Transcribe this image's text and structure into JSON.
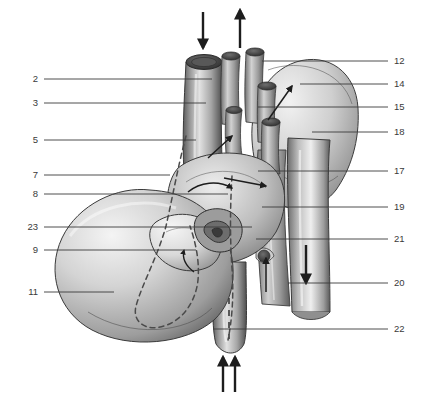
{
  "figure": {
    "style": "grayscale pen-and-ink anatomical illustration",
    "background_color": "#ffffff",
    "line_color": "#3a3a3a",
    "label_color": "#3a3a3a",
    "ink_dark": "#2b2b2b",
    "ink_mid": "#8d8d8d",
    "ink_light": "#d8d8d8"
  },
  "labels_left": [
    {
      "number": "2",
      "y": 79,
      "line_to_x": 212
    },
    {
      "number": "3",
      "y": 103,
      "line_to_x": 206
    },
    {
      "number": "5",
      "y": 140,
      "line_to_x": 196
    },
    {
      "number": "7",
      "y": 175,
      "line_to_x": 170
    },
    {
      "number": "8",
      "y": 194,
      "line_to_x": 228
    },
    {
      "number": "23",
      "y": 227,
      "line_to_x": 252
    },
    {
      "number": "9",
      "y": 250,
      "line_to_x": 196
    },
    {
      "number": "11",
      "y": 292,
      "line_to_x": 114
    }
  ],
  "labels_right": [
    {
      "number": "12",
      "y": 61,
      "line_from_x": 262
    },
    {
      "number": "14",
      "y": 84,
      "line_from_x": 300
    },
    {
      "number": "15",
      "y": 107,
      "line_from_x": 258
    },
    {
      "number": "18",
      "y": 132,
      "line_from_x": 312
    },
    {
      "number": "17",
      "y": 171,
      "line_from_x": 258
    },
    {
      "number": "19",
      "y": 207,
      "line_from_x": 262
    },
    {
      "number": "21",
      "y": 239,
      "line_from_x": 256
    },
    {
      "number": "20",
      "y": 283,
      "line_from_x": 288
    },
    {
      "number": "22",
      "y": 329,
      "line_from_x": 213
    }
  ],
  "flow_arrows": [
    {
      "name": "superior-vena-cava-inflow",
      "direction": "down",
      "x": 203,
      "y1": 12,
      "y2": 50
    },
    {
      "name": "aorta-outflow",
      "direction": "up",
      "x": 240,
      "y1": 50,
      "y2": 10
    },
    {
      "name": "descending-aorta-flow",
      "direction": "down",
      "x": 306,
      "y1": 245,
      "y2": 285
    },
    {
      "name": "inferior-vena-cava-inflow-left",
      "direction": "up",
      "x": 223,
      "y1": 392,
      "y2": 355
    },
    {
      "name": "inferior-vena-cava-inflow-right",
      "direction": "up",
      "x": 235,
      "y1": 392,
      "y2": 355
    }
  ],
  "internal_arrows": [
    {
      "name": "aortic-arch-flow-arrow",
      "x1": 268,
      "y1": 118,
      "x2": 290,
      "y2": 84
    },
    {
      "name": "pulmonary-trunk-flow-arrow",
      "x1": 205,
      "y1": 155,
      "x2": 230,
      "y2": 133
    },
    {
      "name": "right-atrium-flow-arrow",
      "x1": 223,
      "y1": 178,
      "x2": 264,
      "y2": 186
    },
    {
      "name": "tricuspid-flow-arrow",
      "x1": 208,
      "y1": 172,
      "x2": 232,
      "y2": 182
    },
    {
      "name": "coronary-sinus-flow-arrow",
      "x1": 185,
      "y1": 275,
      "x2": 202,
      "y2": 291
    },
    {
      "name": "pulmonary-vein-flow-arrow",
      "x1": 266,
      "y1": 290,
      "x2": 266,
      "y2": 258
    }
  ],
  "curved_arrows": [
    {
      "name": "atrioventricular-curved-arrow",
      "label": "curved flow arrow over ventricle base"
    }
  ]
}
